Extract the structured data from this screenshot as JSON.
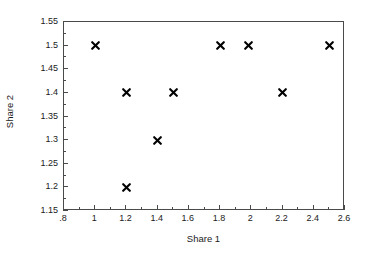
{
  "chart_data": {
    "type": "scatter",
    "title": "",
    "xlabel": "Share 1",
    "ylabel": "Share 2",
    "xlim": [
      0.8,
      2.6
    ],
    "ylim": [
      1.15,
      1.55
    ],
    "grid": false,
    "legend": null,
    "marker": "x-cross",
    "marker_color": "#000000",
    "frame_color": "#4a4a4a",
    "background": "#ffffff",
    "xticks": [
      0.8,
      1.0,
      1.2,
      1.4,
      1.6,
      1.8,
      2.0,
      2.2,
      2.4,
      2.6
    ],
    "xtick_labels": [
      ".8",
      "1",
      "1.2",
      "1.4",
      "1.6",
      "1.8",
      "2",
      "2.2",
      "2.4",
      "2.6"
    ],
    "xminor_ticks": [
      0.9,
      1.1,
      1.3,
      1.5,
      1.7,
      1.9,
      2.1,
      2.3,
      2.5
    ],
    "yticks": [
      1.15,
      1.2,
      1.25,
      1.3,
      1.35,
      1.4,
      1.45,
      1.5,
      1.55
    ],
    "ytick_labels": [
      "1.15",
      "1.2",
      "1.25",
      "1.3",
      "1.35",
      "1.4",
      "1.45",
      "1.5",
      "1.55"
    ],
    "yminor_ticks": [
      1.175,
      1.225,
      1.275,
      1.325,
      1.375,
      1.425,
      1.475,
      1.525
    ],
    "points": [
      {
        "x": 1.0,
        "y": 1.5
      },
      {
        "x": 1.2,
        "y": 1.4
      },
      {
        "x": 1.2,
        "y": 1.2
      },
      {
        "x": 1.4,
        "y": 1.3
      },
      {
        "x": 1.5,
        "y": 1.4
      },
      {
        "x": 1.8,
        "y": 1.5
      },
      {
        "x": 1.98,
        "y": 1.5
      },
      {
        "x": 2.2,
        "y": 1.4
      },
      {
        "x": 2.5,
        "y": 1.5
      }
    ]
  }
}
